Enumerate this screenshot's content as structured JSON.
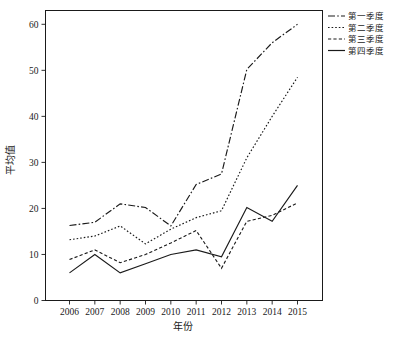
{
  "chart_data": {
    "type": "line",
    "title": "",
    "xlabel": "年份",
    "ylabel": "平均值",
    "categories": [
      "2006",
      "2007",
      "2008",
      "2009",
      "2010",
      "2011",
      "2012",
      "2013",
      "2014",
      "2015"
    ],
    "x": [
      2006,
      2007,
      2008,
      2009,
      2010,
      2011,
      2012,
      2013,
      2014,
      2015
    ],
    "xlim": [
      2005.5,
      2015.5
    ],
    "ylim": [
      0,
      63
    ],
    "yticks": [
      0,
      10,
      20,
      30,
      40,
      50,
      60
    ],
    "ytick_labels": [
      "0",
      "10",
      "20",
      "30",
      "40",
      "50",
      "60"
    ],
    "grid": false,
    "legend_position": "top-right-outside",
    "series": [
      {
        "name": "第一季度",
        "style": "dash-dot",
        "color": "#1a1a1a",
        "values": [
          16.3,
          17.0,
          21.0,
          20.2,
          16.2,
          25.2,
          27.5,
          50.2,
          56.0,
          60.0
        ]
      },
      {
        "name": "第二季度",
        "style": "dotted",
        "color": "#1a1a1a",
        "values": [
          13.2,
          14.0,
          16.2,
          12.3,
          15.5,
          18.0,
          19.5,
          31.0,
          40.0,
          48.5
        ]
      },
      {
        "name": "第三季度",
        "style": "dashed",
        "color": "#1a1a1a",
        "values": [
          8.9,
          11.0,
          8.2,
          10.0,
          12.5,
          15.2,
          7.0,
          17.2,
          18.5,
          21.2
        ]
      },
      {
        "name": "第四季度",
        "style": "solid",
        "color": "#1a1a1a",
        "values": [
          6.0,
          10.0,
          6.0,
          8.0,
          10.0,
          11.0,
          9.5,
          20.2,
          17.2,
          25.0
        ]
      }
    ]
  },
  "legend": {
    "items": [
      {
        "label": "第一季度"
      },
      {
        "label": "第二季度"
      },
      {
        "label": "第三季度"
      },
      {
        "label": "第四季度"
      }
    ]
  },
  "axes": {
    "x_title": "年份",
    "y_title": "平均值",
    "x_tick_labels": [
      "2006",
      "2007",
      "2008",
      "2009",
      "2010",
      "2011",
      "2012",
      "2013",
      "2014",
      "2015"
    ],
    "y_tick_labels": [
      "0",
      "10",
      "20",
      "30",
      "40",
      "50",
      "60"
    ]
  }
}
